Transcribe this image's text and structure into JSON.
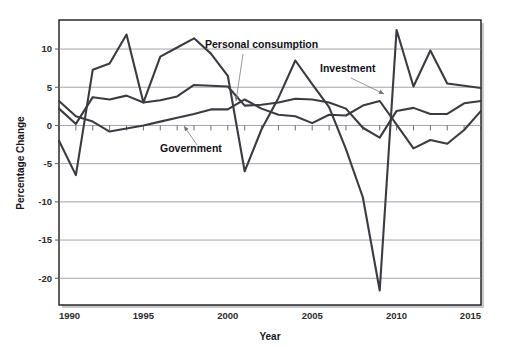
{
  "chart_data": {
    "type": "line",
    "title": "",
    "subtitle": "",
    "xlabel": "Year",
    "ylabel": "Percentage Change",
    "xlim": [
      1990,
      2015
    ],
    "ylim": [
      -23.5,
      13.8
    ],
    "xticks": [
      1990,
      1995,
      2000,
      2005,
      2010,
      2015
    ],
    "xtick_labels": [
      "1990",
      "1995",
      "2000",
      "2005",
      "2010",
      "2015"
    ],
    "yticks": [
      10,
      5,
      0,
      -5,
      -10,
      -15,
      -20
    ],
    "ytick_labels": [
      "10",
      "5",
      "0",
      "-5",
      "-10",
      "-15",
      "-20"
    ],
    "minor_xticks_interval": 1,
    "grid": "horizontal",
    "legend_position": "inline-annotations",
    "line_color": "#3b3b42",
    "gridline_color": "#8d8d94",
    "frame_color": "#1b1b1b",
    "background_color": "#ffffff",
    "x": [
      1990,
      1991,
      1992,
      1993,
      1994,
      1995,
      1996,
      1997,
      1998,
      1999,
      2000,
      2001,
      2002,
      2003,
      2004,
      2005,
      2006,
      2007,
      2008,
      2009,
      2010,
      2011,
      2012,
      2013,
      2014,
      2015
    ],
    "series": [
      {
        "name": "Personal consumption",
        "annotation_label": "Personal consumption",
        "values": [
          2.2,
          0.2,
          3.7,
          3.4,
          3.9,
          3.0,
          3.3,
          3.8,
          5.3,
          5.2,
          5.1,
          2.6,
          2.7,
          3.0,
          3.5,
          3.4,
          3.0,
          2.2,
          -0.3,
          -1.6,
          1.9,
          2.3,
          1.5,
          1.5,
          2.9,
          3.2
        ]
      },
      {
        "name": "Investment",
        "annotation_label": "Investment",
        "values": [
          -2.0,
          -6.5,
          7.3,
          8.1,
          11.9,
          3.0,
          9.0,
          10.2,
          11.4,
          9.4,
          6.5,
          -6.0,
          -0.5,
          3.6,
          8.5,
          5.4,
          2.4,
          -3.1,
          -9.4,
          -21.6,
          12.5,
          5.1,
          9.8,
          5.5,
          5.2,
          4.9
        ]
      },
      {
        "name": "Government",
        "annotation_label": "Government",
        "values": [
          3.2,
          1.2,
          0.5,
          -0.8,
          -0.4,
          0.0,
          0.5,
          1.0,
          1.5,
          2.1,
          2.1,
          3.4,
          2.2,
          1.4,
          1.2,
          0.3,
          1.4,
          1.3,
          2.6,
          3.2,
          0.1,
          -3.0,
          -1.9,
          -2.4,
          -0.6,
          1.9
        ]
      }
    ],
    "annotations": [
      {
        "label": "Personal consumption",
        "text_x": 205,
        "text_y": 48,
        "leader_from_x": 243,
        "leader_from_y": 54,
        "leader_to_x": 236,
        "leader_to_y": 101
      },
      {
        "label": "Investment",
        "text_x": 320,
        "text_y": 72,
        "leader_from_x": 351,
        "leader_from_y": 78,
        "leader_to_x": 384,
        "leader_to_y": 94
      },
      {
        "label": "Government",
        "text_x": 160,
        "text_y": 152,
        "leader_from_x": 197,
        "leader_from_y": 145,
        "leader_to_x": 184,
        "leader_to_y": 126
      }
    ]
  },
  "axes": {
    "ylabel": "Percentage Change",
    "xlabel": "Year"
  }
}
